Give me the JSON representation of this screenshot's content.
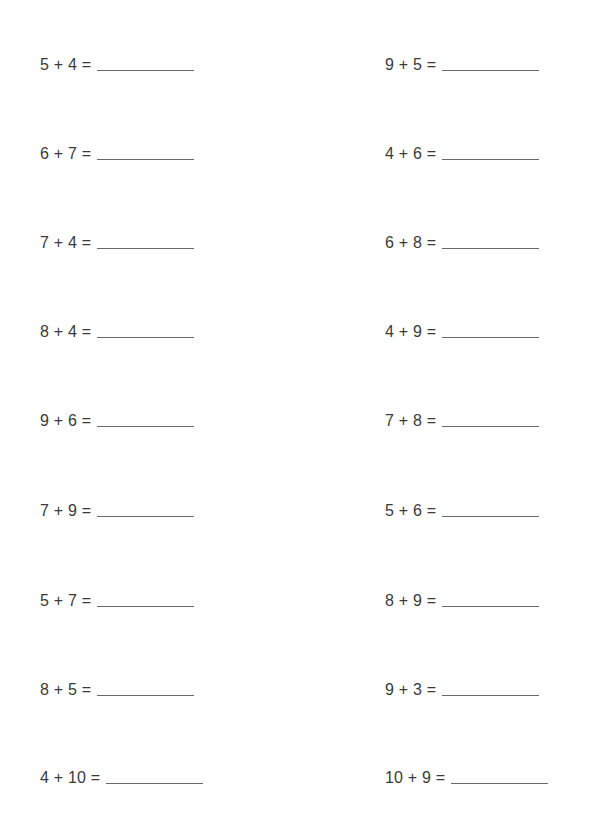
{
  "worksheet": {
    "left_column": [
      {
        "expression": "5 + 4 ="
      },
      {
        "expression": "6 + 7 ="
      },
      {
        "expression": "7 + 4 ="
      },
      {
        "expression": "8 + 4 ="
      },
      {
        "expression": "9 + 6 ="
      },
      {
        "expression": "7 + 9 ="
      },
      {
        "expression": "5 + 7 ="
      },
      {
        "expression": "8 + 5 ="
      },
      {
        "expression": "4 + 10 ="
      }
    ],
    "right_column": [
      {
        "expression": "9 + 5 ="
      },
      {
        "expression": "4 + 6 ="
      },
      {
        "expression": "6 + 8 ="
      },
      {
        "expression": "4 + 9 ="
      },
      {
        "expression": "7 + 8 ="
      },
      {
        "expression": "5 + 6 ="
      },
      {
        "expression": "8 + 9 ="
      },
      {
        "expression": "9 + 3 ="
      },
      {
        "expression": "10 + 9 ="
      }
    ]
  }
}
